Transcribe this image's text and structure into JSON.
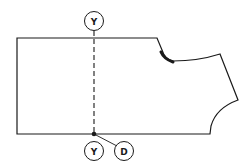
{
  "diagram": {
    "type": "garment-pattern-piece",
    "colors": {
      "stroke": "#1a1a1a",
      "background": "#ffffff"
    },
    "labels": {
      "top_marker": "Y",
      "bottom_marker": "Y",
      "dot_marker": "D"
    },
    "elements": {
      "outline": "pattern piece outline (bodice/front with neckline and armhole)",
      "fold_line": "dashed vertical line",
      "neck_marking": "thick curved neckline segment",
      "point": "filled dot on bottom edge"
    }
  }
}
